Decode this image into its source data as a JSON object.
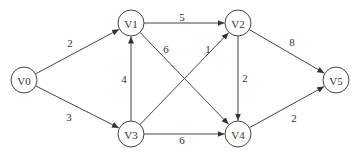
{
  "diagram": {
    "type": "directed-weighted-graph",
    "node_radius": 13,
    "colors": {
      "stroke": "#444444",
      "text": "#333333",
      "background": "#ffffff"
    },
    "nodes": [
      {
        "id": "V0",
        "label": "V0",
        "x": 24,
        "y": 80
      },
      {
        "id": "V1",
        "label": "V1",
        "x": 131,
        "y": 23
      },
      {
        "id": "V2",
        "label": "V2",
        "x": 238,
        "y": 23
      },
      {
        "id": "V3",
        "label": "V3",
        "x": 131,
        "y": 134
      },
      {
        "id": "V4",
        "label": "V4",
        "x": 238,
        "y": 134
      },
      {
        "id": "V5",
        "label": "V5",
        "x": 336,
        "y": 80
      }
    ],
    "edges": [
      {
        "from": "V0",
        "to": "V1",
        "weight": "2",
        "lx": 70,
        "ly": 43
      },
      {
        "from": "V0",
        "to": "V3",
        "weight": "3",
        "lx": 69,
        "ly": 117
      },
      {
        "from": "V1",
        "to": "V2",
        "weight": "5",
        "lx": 182,
        "ly": 17
      },
      {
        "from": "V1",
        "to": "V4",
        "weight": "6",
        "lx": 166,
        "ly": 49
      },
      {
        "from": "V3",
        "to": "V1",
        "weight": "4",
        "lx": 124,
        "ly": 79
      },
      {
        "from": "V3",
        "to": "V2",
        "weight": "1",
        "lx": 208,
        "ly": 49
      },
      {
        "from": "V3",
        "to": "V4",
        "weight": "6",
        "lx": 182,
        "ly": 140
      },
      {
        "from": "V2",
        "to": "V4",
        "weight": "2",
        "lx": 245,
        "ly": 78
      },
      {
        "from": "V2",
        "to": "V5",
        "weight": "8",
        "lx": 292,
        "ly": 42
      },
      {
        "from": "V4",
        "to": "V5",
        "weight": "2",
        "lx": 294,
        "ly": 118
      }
    ]
  }
}
